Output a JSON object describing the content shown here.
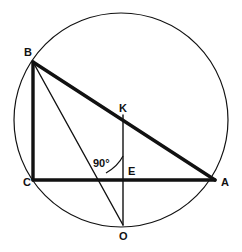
{
  "figure": {
    "stroke_color": "#111111",
    "background_color": "#ffffff",
    "canvas": {
      "width": 242,
      "height": 252
    }
  },
  "circle": {
    "name": "circumscribed-circle",
    "cx": 121,
    "cy": 120,
    "r": 107,
    "stroke_width": 1.2
  },
  "points": [
    {
      "id": "B",
      "label": "B",
      "x": 33,
      "y": 62,
      "label_x": 24,
      "label_y": 56
    },
    {
      "id": "C",
      "label": "C",
      "x": 33,
      "y": 180,
      "label_x": 23,
      "label_y": 186
    },
    {
      "id": "A",
      "label": "A",
      "x": 215,
      "y": 180,
      "label_x": 221,
      "label_y": 186
    },
    {
      "id": "K",
      "label": "K",
      "x": 123,
      "y": 115,
      "label_x": 119,
      "label_y": 112
    },
    {
      "id": "E",
      "label": "E",
      "x": 123,
      "y": 180,
      "label_x": 128,
      "label_y": 175
    },
    {
      "id": "O",
      "label": "O",
      "x": 123,
      "y": 225,
      "label_x": 119,
      "label_y": 240
    }
  ],
  "segments": [
    {
      "id": "BA",
      "name": "hypotenuse-b-to-a",
      "x1": 33,
      "y1": 62,
      "x2": 215,
      "y2": 180,
      "width": 3.4
    },
    {
      "id": "BC",
      "name": "side-b-to-c",
      "x1": 33,
      "y1": 62,
      "x2": 33,
      "y2": 180,
      "width": 3.4
    },
    {
      "id": "CA",
      "name": "side-c-to-a",
      "x1": 33,
      "y1": 180,
      "x2": 215,
      "y2": 180,
      "width": 3.4
    },
    {
      "id": "BO",
      "name": "chord-b-to-o",
      "x1": 33,
      "y1": 62,
      "x2": 123,
      "y2": 225,
      "width": 1.4
    },
    {
      "id": "KO",
      "name": "vertical-k-to-o",
      "x1": 123,
      "y1": 115,
      "x2": 123,
      "y2": 225,
      "width": 1.4
    }
  ],
  "angle_marker": {
    "name": "right-angle-at-e",
    "value": "90",
    "degree_symbol": "°",
    "text": "90°",
    "text_x": 93,
    "text_y": 167,
    "arc_path": "M 123 156 Q 118 166 106 173",
    "stroke_width": 1.2
  }
}
